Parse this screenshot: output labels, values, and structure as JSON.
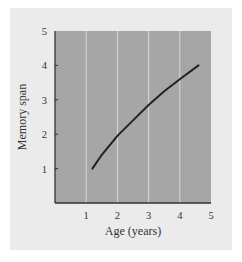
{
  "chart_data": {
    "type": "line",
    "title": "",
    "xlabel": "Age (years)",
    "ylabel": "Memory span",
    "xlim": [
      0,
      5
    ],
    "ylim": [
      0,
      5
    ],
    "xticks": [
      1,
      2,
      3,
      4,
      5
    ],
    "yticks": [
      1,
      2,
      3,
      4,
      5
    ],
    "grid": "vertical lines only",
    "legend": "none",
    "series": [
      {
        "name": "Memory span",
        "x": [
          1.2,
          1.5,
          2.0,
          2.5,
          3.0,
          3.5,
          4.0,
          4.6
        ],
        "y": [
          1.0,
          1.4,
          1.95,
          2.4,
          2.85,
          3.25,
          3.6,
          4.0
        ]
      }
    ],
    "colors": {
      "panel_background": "#ebebeb",
      "plot_background": "#a6a6a6",
      "gridline": "#d8d8d8",
      "line": "#222222",
      "axis": "#333333"
    }
  }
}
